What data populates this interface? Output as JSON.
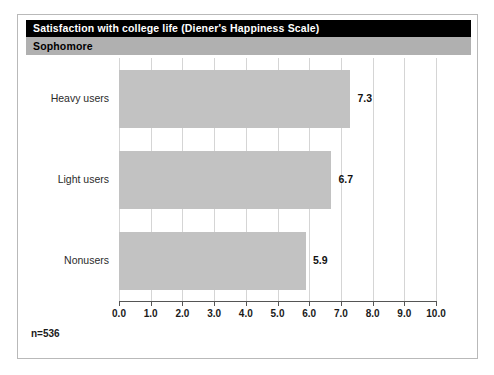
{
  "figure": {
    "title": "Satisfaction with college life (Diener's Happiness Scale)",
    "subtitle": "Sophomore",
    "footnote": "n=536",
    "title_bg": "#000000",
    "title_fg": "#ffffff",
    "subtitle_bg": "#b0b0b0",
    "subtitle_fg": "#000000",
    "bar_color": "#c2c2c2",
    "grid_color": "#d5d5d5",
    "axis_color": "#555555",
    "frame_color": "#b9b9b9"
  },
  "chart_data": {
    "type": "bar",
    "orientation": "horizontal",
    "title": "Satisfaction with college life (Diener's Happiness Scale)",
    "subtitle": "Sophomore",
    "categories": [
      "Heavy users",
      "Light users",
      "Nonusers"
    ],
    "values": [
      7.3,
      6.7,
      5.9
    ],
    "value_labels": [
      "7.3",
      "6.7",
      "5.9"
    ],
    "xlabel": "",
    "ylabel": "",
    "xlim": [
      0.0,
      10.0
    ],
    "xticks": [
      0.0,
      1.0,
      2.0,
      3.0,
      4.0,
      5.0,
      6.0,
      7.0,
      8.0,
      9.0,
      10.0
    ],
    "xticklabels": [
      "0.0",
      "1.0",
      "2.0",
      "3.0",
      "4.0",
      "5.0",
      "6.0",
      "7.0",
      "8.0",
      "9.0",
      "10.0"
    ],
    "grid": true,
    "legend": false,
    "annotation": "n=536"
  }
}
